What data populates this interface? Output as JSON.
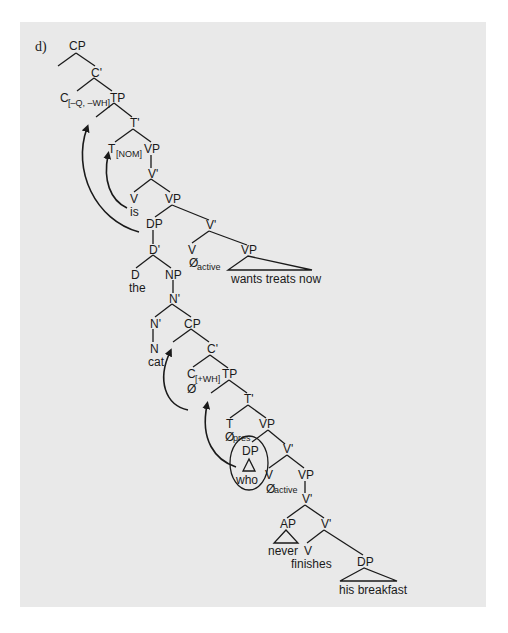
{
  "figure": {
    "label": "d)",
    "colors": {
      "panel_bg": "#e9e9e9",
      "ink": "#1a1a1a"
    }
  },
  "nodes": {
    "cp_top": "CP",
    "cbar_top": "C'",
    "c_top": "C",
    "c_top_features": "[–Q, –WH]",
    "tp_top": "TP",
    "tbar_top": "T'",
    "t_top": "T",
    "t_top_features": "[NOM]",
    "vp1": "VP",
    "vbar1": "V'",
    "v_is": "V",
    "word_is": "is",
    "vp2": "VP",
    "dp_subj": "DP",
    "dbar": "D'",
    "d_the": "D",
    "word_the": "the",
    "np": "NP",
    "nbar_upper": "N'",
    "nbar_lower": "N'",
    "n_cat": "N",
    "word_cat": "cat",
    "vbar2": "V'",
    "v_active1": "V",
    "null_active1": "Ø",
    "null_active1_sub": "active",
    "vp_wants": "VP",
    "phrase_wants": "wants treats now",
    "cp_rel": "CP",
    "cbar_rel": "C'",
    "c_rel": "C",
    "c_rel_features": "[+WH]",
    "null_c": "Ø",
    "tp_rel": "TP",
    "tbar_rel": "T'",
    "t_rel": "T",
    "null_pres": "Ø",
    "null_pres_sub": "pres",
    "vp_rel": "VP",
    "dp_who": "DP",
    "word_who": "who",
    "vbar_rel": "V'",
    "v_active2": "V",
    "null_active2": "Ø",
    "null_active2_sub": "active",
    "vp_rel2": "VP",
    "vbar_rel2": "V'",
    "ap": "AP",
    "word_never": "never",
    "vbar_rel3": "V'",
    "v_finishes": "V",
    "word_finishes": "finishes",
    "dp_obj": "DP",
    "phrase_breakfast": "his breakfast"
  }
}
